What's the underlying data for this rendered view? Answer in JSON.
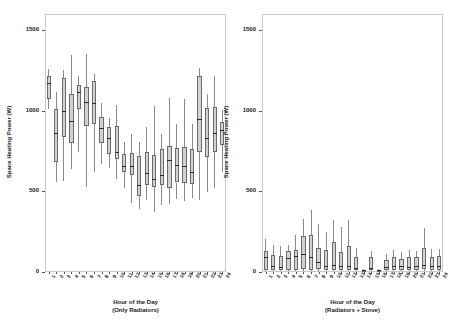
{
  "figure": {
    "width": 457,
    "height": 324,
    "background": "#ffffff",
    "box_fill": "#d2d2d2",
    "box_edge": "#6b6b6b",
    "median_color": "#2a2a2a",
    "whisker_color": "#8a8a8a",
    "frame_color": "#c8c8c8"
  },
  "chart_data": [
    {
      "type": "box",
      "panel": "left",
      "title": "",
      "xlabel": "Hour of the Day\n(Only Radiators)",
      "xlabel_line1": "Hour of the Day",
      "xlabel_line2": "(Only Radiators)",
      "ylabel": "Space Heating Power (W)",
      "ylim": [
        0,
        1600
      ],
      "yticks": [
        0,
        500,
        1000,
        1500
      ],
      "ytick_labels": [
        "0",
        "500",
        "1000",
        "1500"
      ],
      "grid": false,
      "categories": [
        "1",
        "2",
        "3",
        "4",
        "5",
        "6",
        "7",
        "8",
        "9",
        "10",
        "11",
        "12",
        "13",
        "14",
        "15",
        "16",
        "17",
        "18",
        "19",
        "20",
        "21",
        "22",
        "23",
        "24"
      ],
      "boxes": [
        {
          "hour": "1",
          "whisker_low": 1010,
          "q1": 1075,
          "median": 1175,
          "q3": 1215,
          "whisker_high": 1260
        },
        {
          "hour": "2",
          "whisker_low": 560,
          "q1": 680,
          "median": 865,
          "q3": 1010,
          "whisker_high": 1115
        },
        {
          "hour": "3",
          "whisker_low": 565,
          "q1": 835,
          "median": 1000,
          "q3": 1205,
          "whisker_high": 1250
        },
        {
          "hour": "4",
          "whisker_low": 640,
          "q1": 800,
          "median": 935,
          "q3": 1105,
          "whisker_high": 1345
        },
        {
          "hour": "5",
          "whisker_low": 745,
          "q1": 1010,
          "median": 1115,
          "q3": 1160,
          "whisker_high": 1215
        },
        {
          "hour": "6",
          "whisker_low": 525,
          "q1": 905,
          "median": 1055,
          "q3": 1150,
          "whisker_high": 1350
        },
        {
          "hour": "7",
          "whisker_low": 620,
          "q1": 915,
          "median": 1050,
          "q3": 1185,
          "whisker_high": 1225
        },
        {
          "hour": "8",
          "whisker_low": 670,
          "q1": 800,
          "median": 890,
          "q3": 960,
          "whisker_high": 1045
        },
        {
          "hour": "9",
          "whisker_low": 645,
          "q1": 730,
          "median": 830,
          "q3": 900,
          "whisker_high": 955
        },
        {
          "hour": "10",
          "whisker_low": 575,
          "q1": 700,
          "median": 745,
          "q3": 905,
          "whisker_high": 1035
        },
        {
          "hour": "11",
          "whisker_low": 520,
          "q1": 620,
          "median": 660,
          "q3": 730,
          "whisker_high": 805
        },
        {
          "hour": "12",
          "whisker_low": 430,
          "q1": 600,
          "median": 655,
          "q3": 740,
          "whisker_high": 855
        },
        {
          "hour": "13",
          "whisker_low": 390,
          "q1": 470,
          "median": 540,
          "q3": 720,
          "whisker_high": 805
        },
        {
          "hour": "14",
          "whisker_low": 445,
          "q1": 540,
          "median": 615,
          "q3": 745,
          "whisker_high": 900
        },
        {
          "hour": "15",
          "whisker_low": 370,
          "q1": 525,
          "median": 575,
          "q3": 725,
          "whisker_high": 1030
        },
        {
          "hour": "16",
          "whisker_low": 415,
          "q1": 540,
          "median": 600,
          "q3": 760,
          "whisker_high": 855
        },
        {
          "hour": "17",
          "whisker_low": 420,
          "q1": 520,
          "median": 695,
          "q3": 780,
          "whisker_high": 1080
        },
        {
          "hour": "18",
          "whisker_low": 455,
          "q1": 555,
          "median": 665,
          "q3": 770,
          "whisker_high": 915
        },
        {
          "hour": "19",
          "whisker_low": 440,
          "q1": 555,
          "median": 660,
          "q3": 775,
          "whisker_high": 1075
        },
        {
          "hour": "20",
          "whisker_low": 460,
          "q1": 545,
          "median": 620,
          "q3": 760,
          "whisker_high": 920
        },
        {
          "hour": "21",
          "whisker_low": 445,
          "q1": 745,
          "median": 950,
          "q3": 1215,
          "whisker_high": 1265
        },
        {
          "hour": "22",
          "whisker_low": 495,
          "q1": 715,
          "median": 830,
          "q3": 1020,
          "whisker_high": 1105
        },
        {
          "hour": "23",
          "whisker_low": 520,
          "q1": 745,
          "median": 860,
          "q3": 1025,
          "whisker_high": 1215
        },
        {
          "hour": "24",
          "whisker_low": 620,
          "q1": 790,
          "median": 880,
          "q3": 930,
          "whisker_high": 1005
        }
      ]
    },
    {
      "type": "box",
      "panel": "right",
      "title": "",
      "xlabel": "Hour of the Day\n(Radiators + Stove)",
      "xlabel_line1": "Hour of the Day",
      "xlabel_line2": "(Radiators + Stove)",
      "ylabel": "Space Heating Power (W)",
      "ylim": [
        0,
        1600
      ],
      "yticks": [
        0,
        500,
        1000,
        1500
      ],
      "ytick_labels": [
        "0",
        "500",
        "1000",
        "1500"
      ],
      "grid": false,
      "categories": [
        "1",
        "2",
        "3",
        "4",
        "5",
        "6",
        "7",
        "8",
        "9",
        "10",
        "11",
        "12",
        "13",
        "14",
        "15",
        "16",
        "17",
        "18",
        "19",
        "20",
        "21",
        "22",
        "23",
        "24"
      ],
      "boxes": [
        {
          "hour": "1",
          "whisker_low": 5,
          "q1": 15,
          "median": 90,
          "q3": 130,
          "whisker_high": 205
        },
        {
          "hour": "2",
          "whisker_low": 5,
          "q1": 15,
          "median": 35,
          "q3": 105,
          "whisker_high": 165
        },
        {
          "hour": "3",
          "whisker_low": 5,
          "q1": 15,
          "median": 30,
          "q3": 100,
          "whisker_high": 160
        },
        {
          "hour": "4",
          "whisker_low": 5,
          "q1": 15,
          "median": 85,
          "q3": 130,
          "whisker_high": 170
        },
        {
          "hour": "5",
          "whisker_low": 5,
          "q1": 15,
          "median": 100,
          "q3": 135,
          "whisker_high": 230
        },
        {
          "hour": "6",
          "whisker_low": 5,
          "q1": 20,
          "median": 110,
          "q3": 225,
          "whisker_high": 330
        },
        {
          "hour": "7",
          "whisker_low": 5,
          "q1": 15,
          "median": 95,
          "q3": 230,
          "whisker_high": 385
        },
        {
          "hour": "8",
          "whisker_low": 5,
          "q1": 20,
          "median": 60,
          "q3": 150,
          "whisker_high": 300
        },
        {
          "hour": "9",
          "whisker_low": 5,
          "q1": 15,
          "median": 40,
          "q3": 135,
          "whisker_high": 245
        },
        {
          "hour": "10",
          "whisker_low": 5,
          "q1": 15,
          "median": 45,
          "q3": 185,
          "whisker_high": 320
        },
        {
          "hour": "11",
          "whisker_low": 5,
          "q1": 15,
          "median": 40,
          "q3": 125,
          "whisker_high": 280
        },
        {
          "hour": "12",
          "whisker_low": 5,
          "q1": 15,
          "median": 40,
          "q3": 160,
          "whisker_high": 320
        },
        {
          "hour": "13",
          "whisker_low": 5,
          "q1": 10,
          "median": 25,
          "q3": 95,
          "whisker_high": 150
        },
        {
          "hour": "14",
          "whisker_low": 5,
          "q1": 5,
          "median": 10,
          "q3": 15,
          "whisker_high": 20
        },
        {
          "hour": "15",
          "whisker_low": 5,
          "q1": 15,
          "median": 25,
          "q3": 90,
          "whisker_high": 130
        },
        {
          "hour": "16",
          "whisker_low": 5,
          "q1": 5,
          "median": 10,
          "q3": 15,
          "whisker_high": 20
        },
        {
          "hour": "17",
          "whisker_low": 5,
          "q1": 15,
          "median": 30,
          "q3": 75,
          "whisker_high": 110
        },
        {
          "hour": "18",
          "whisker_low": 5,
          "q1": 15,
          "median": 35,
          "q3": 90,
          "whisker_high": 135
        },
        {
          "hour": "19",
          "whisker_low": 5,
          "q1": 15,
          "median": 35,
          "q3": 80,
          "whisker_high": 125
        },
        {
          "hour": "20",
          "whisker_low": 5,
          "q1": 15,
          "median": 30,
          "q3": 90,
          "whisker_high": 135
        },
        {
          "hour": "21",
          "whisker_low": 5,
          "q1": 15,
          "median": 35,
          "q3": 90,
          "whisker_high": 130
        },
        {
          "hour": "22",
          "whisker_low": 5,
          "q1": 20,
          "median": 45,
          "q3": 150,
          "whisker_high": 275
        },
        {
          "hour": "23",
          "whisker_low": 5,
          "q1": 15,
          "median": 35,
          "q3": 95,
          "whisker_high": 140
        },
        {
          "hour": "24",
          "whisker_low": 5,
          "q1": 15,
          "median": 35,
          "q3": 100,
          "whisker_high": 145
        }
      ]
    }
  ]
}
